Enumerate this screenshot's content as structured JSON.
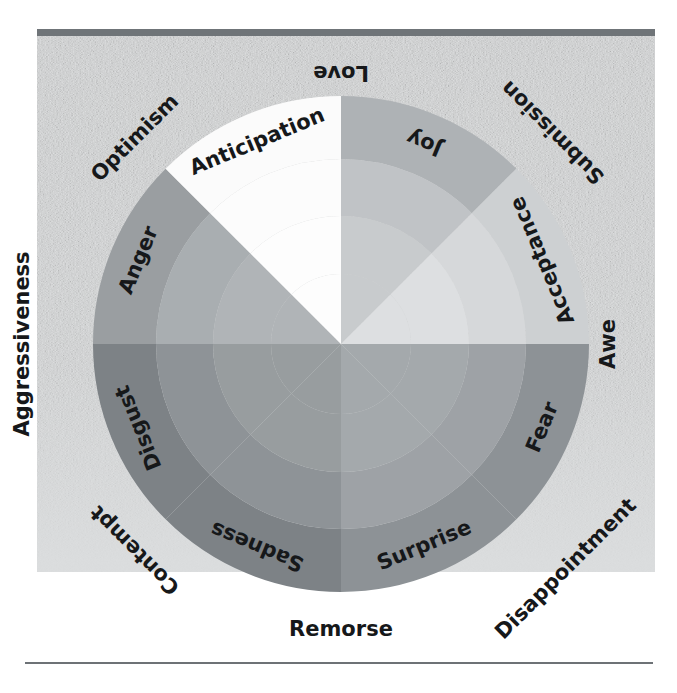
{
  "figure": {
    "kind": "plutchik-wheel-of-emotions",
    "center": {
      "x": 341,
      "y": 344
    },
    "outer_radius": 248,
    "background_panel": {
      "x": 37,
      "y": 36,
      "width": 618,
      "height": 536,
      "texture": "mottled-gray-paper"
    },
    "top_bar": {
      "x": 37,
      "y": 29,
      "width": 618,
      "height": 7,
      "color": "#6f7478"
    },
    "bottom_rule": {
      "x": 25,
      "y": 662,
      "width": 628,
      "height": 2,
      "color": "#6d7276"
    }
  },
  "chart_data": {
    "type": "pie",
    "title": "",
    "xlabel": "",
    "ylabel": "",
    "legend_position": "none",
    "grid": false,
    "categories": [
      "Joy",
      "Acceptance",
      "Fear",
      "Surprise",
      "Sadness",
      "Disgust",
      "Anger",
      "Anticipation"
    ],
    "values": [
      45,
      45,
      45,
      45,
      45,
      45,
      45,
      45
    ],
    "ring_radii": [
      248,
      185,
      128,
      70
    ],
    "sector_start_angle_deg": -112.5,
    "series": [
      {
        "name": "primary-emotions-outer-ring",
        "values": [
          45,
          45,
          45,
          45,
          45,
          45,
          45,
          45
        ],
        "labels": [
          "Joy",
          "Acceptance",
          "Fear",
          "Surprise",
          "Sadness",
          "Disgust",
          "Anger",
          "Anticipation"
        ],
        "colors": [
          "#aeb2b5",
          "#cdd0d2",
          "#8d9296",
          "#8d9296",
          "#7d8286",
          "#7d8286",
          "#9a9ea1",
          "#fbfbfb"
        ]
      },
      {
        "name": "middle-ring",
        "values": [
          45,
          45,
          45,
          45,
          45,
          45,
          45,
          45
        ],
        "colors": [
          "#c0c3c6",
          "#d6d8da",
          "#9ea2a6",
          "#9ea2a6",
          "#8e9397",
          "#8e9397",
          "#a9aeb1",
          "#fcfcfc"
        ]
      },
      {
        "name": "inner-ring",
        "values": [
          45,
          45,
          45,
          45,
          45,
          45,
          45,
          45
        ],
        "colors": [
          "#c8cbcd",
          "#dddfe1",
          "#a4a9ac",
          "#a4a9ac",
          "#989d9f",
          "#989d9f",
          "#b0b4b7",
          "#fdfdfd"
        ]
      }
    ],
    "annotations": [
      {
        "label": "Love",
        "kind": "dyad",
        "angle_deg": -90
      },
      {
        "label": "Submission",
        "kind": "dyad",
        "angle_deg": -45
      },
      {
        "label": "Awe",
        "kind": "dyad",
        "angle_deg": 0
      },
      {
        "label": "Disappointment",
        "kind": "dyad",
        "angle_deg": 45
      },
      {
        "label": "Remorse",
        "kind": "dyad",
        "angle_deg": 90
      },
      {
        "label": "Contempt",
        "kind": "dyad",
        "angle_deg": 135
      },
      {
        "label": "Aggressiveness",
        "kind": "dyad",
        "angle_deg": 180
      },
      {
        "label": "Optimism",
        "kind": "dyad",
        "angle_deg": -135
      }
    ]
  },
  "wheel": {
    "primary_emotions": [
      {
        "label": "Joy",
        "mid_angle": -67.5,
        "shade_outer": "#aeb2b5",
        "shade_mid": "#c0c3c6",
        "shade_inner": "#c8cbcd"
      },
      {
        "label": "Acceptance",
        "mid_angle": -22.5,
        "shade_outer": "#cdd0d2",
        "shade_mid": "#d6d8da",
        "shade_inner": "#dddfe1"
      },
      {
        "label": "Fear",
        "mid_angle": 22.5,
        "shade_outer": "#8d9296",
        "shade_mid": "#9ea2a6",
        "shade_inner": "#a4a9ac"
      },
      {
        "label": "Surprise",
        "mid_angle": 67.5,
        "shade_outer": "#8d9296",
        "shade_mid": "#9ea2a6",
        "shade_inner": "#a4a9ac"
      },
      {
        "label": "Sadness",
        "mid_angle": 112.5,
        "shade_outer": "#7d8286",
        "shade_mid": "#8e9397",
        "shade_inner": "#989d9f"
      },
      {
        "label": "Disgust",
        "mid_angle": 157.5,
        "shade_outer": "#7d8286",
        "shade_mid": "#8e9397",
        "shade_inner": "#989d9f"
      },
      {
        "label": "Anger",
        "mid_angle": -157.5,
        "shade_outer": "#9a9ea1",
        "shade_mid": "#a9aeb1",
        "shade_inner": "#b0b4b7"
      },
      {
        "label": "Anticipation",
        "mid_angle": -112.5,
        "shade_outer": "#fbfbfb",
        "shade_mid": "#fcfcfc",
        "shade_inner": "#fdfdfd"
      }
    ],
    "dyads": [
      {
        "label": "Love",
        "angle": -90
      },
      {
        "label": "Submission",
        "angle": -45
      },
      {
        "label": "Awe",
        "angle": 0
      },
      {
        "label": "Disappointment",
        "angle": 45
      },
      {
        "label": "Remorse",
        "angle": 90
      },
      {
        "label": "Contempt",
        "angle": 135
      },
      {
        "label": "Aggressiveness",
        "angle": 180
      },
      {
        "label": "Optimism",
        "angle": -135
      }
    ]
  },
  "colors": {
    "text": "#16181a",
    "rule": "#6d7276",
    "top_bar": "#6f7478",
    "page": "#ffffff"
  }
}
